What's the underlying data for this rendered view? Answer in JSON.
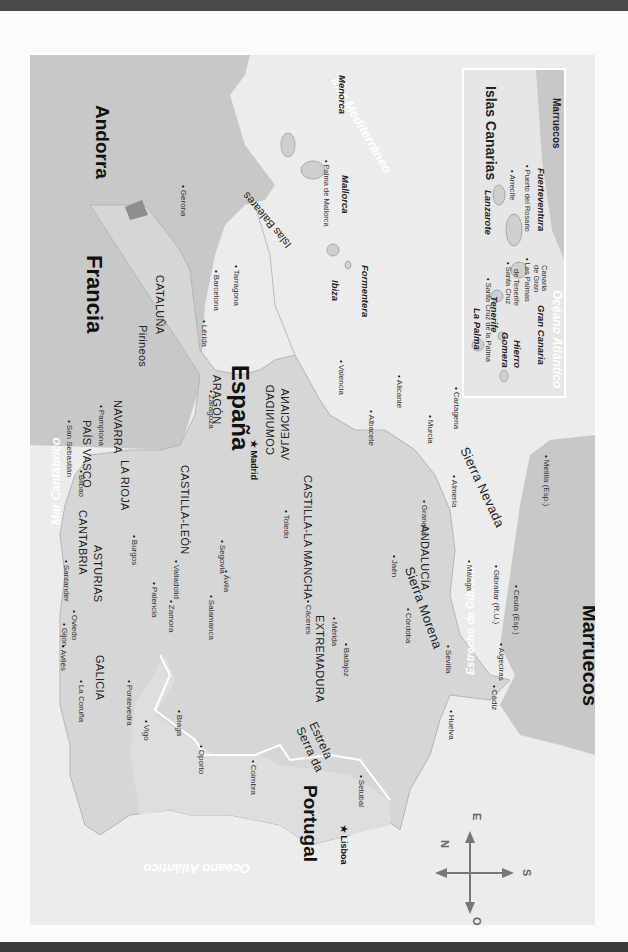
{
  "map": {
    "title": "España",
    "countries": {
      "spain": "España",
      "portugal": "Portugal",
      "france": "Francia",
      "andorra": "Andorra",
      "morocco_main": "Marruecos",
      "morocco_inset": "Marruecos"
    },
    "seas": {
      "cantabrico": "Mar Cantábrico",
      "mediterraneo": "Mar Mediterráneo",
      "atlantico": "Océano Atlántico",
      "atlantico_inset": "Océano Atlántico",
      "gibraltar": "Estrecho de Gibraltar"
    },
    "regions": {
      "galicia": "GALICIA",
      "asturias": "ASTURIAS",
      "cantabria": "CANTABRIA",
      "pais_vasco": "PAÍS VASCO",
      "navarra": "NAVARRA",
      "la_rioja": "LA RIOJA",
      "aragon": "ARAGÓN",
      "cataluna": "CATALUÑA",
      "castilla_leon": "CASTILLA-LEÓN",
      "castilla_mancha": "CASTILLA-LA MANCHA",
      "comunidad": "COMUNIDAD",
      "valenciana": "VALENCIANA",
      "extremadura": "EXTREMADURA",
      "andalucia": "ANDALUCÍA"
    },
    "mountains": {
      "pirineos": "Pirineos",
      "sierra_morena": "Sierra Morena",
      "sierra_nevada": "Sierra Nevada",
      "serra": "Serra da",
      "estrela": "Estrela"
    },
    "capitals": {
      "madrid": "Madrid",
      "lisboa": "Lisboa"
    },
    "cities": {
      "gijon": "Gijón",
      "aviles": "Avilés",
      "oviedo": "Oviedo",
      "santander": "Santander",
      "bilbao": "Bilbao",
      "san_sebastian": "San Sebastián",
      "pamplona": "Pamplona",
      "la_coruna": "La Coruña",
      "pontevedra": "Pontevedra",
      "vigo": "Vigo",
      "braga": "Braga",
      "oporto": "Oporto",
      "coimbra": "Coimbra",
      "setubal": "Setúbal",
      "burgos": "Burgos",
      "palencia": "Palencia",
      "valladolid": "Valladolid",
      "zamora": "Zamora",
      "salamanca": "Salamanca",
      "avila": "Ávila",
      "segovia": "Segovia",
      "toledo": "Toledo",
      "caceres": "Cáceres",
      "merida": "Mérida",
      "badajoz": "Badajoz",
      "huelva": "Huelva",
      "sevilla": "Sevilla",
      "cordoba": "Córdoba",
      "jaen": "Jaén",
      "granada": "Granada",
      "almeria": "Almería",
      "malaga": "Málaga",
      "cadiz": "Cádiz",
      "algeciras": "Algeciras",
      "gibraltar": "Gibraltar (R.U.)",
      "ceuta": "Ceuta (Esp.)",
      "melilla": "Melilla (Esp.)",
      "murcia": "Murcia",
      "cartagena": "Cartagena",
      "alicante": "Alicante",
      "albacete": "Albacete",
      "valencia": "Valencia",
      "zaragoza": "Zaragoza",
      "lerida": "Lérida",
      "barcelona": "Barcelona",
      "tarragona": "Tarragona",
      "gerona": "Gerona",
      "palma": "Palma de Mallorca"
    },
    "baleares": {
      "group": "Islas Baleares",
      "menorca": "Menorca",
      "mallorca": "Mallorca",
      "ibiza": "Ibiza",
      "formentera": "Formentera"
    },
    "canarias": {
      "title": "Islas Canarias",
      "islands": {
        "la_palma": "La Palma",
        "tenerife": "Tenerife",
        "gomera": "Gomera",
        "hierro": "Hierro",
        "gran_canaria": "Gran Canaria",
        "lanzarote": "Lanzarote",
        "fuerteventura": "Fuerteventura"
      },
      "cities": {
        "santa_cruz_palma": "Santa Cruz de la Palma",
        "santa_cruz_tenerife_1": "Santa Cruz",
        "santa_cruz_tenerife_2": "de Tenerife",
        "las_palmas_1": "Las Palmas",
        "las_palmas_2": "de Gran",
        "las_palmas_3": "Canaria",
        "arrecife": "Arrecife",
        "puerto_rosario": "Puerto del Rosario"
      }
    },
    "compass": {
      "n": "N",
      "s": "S",
      "e": "E",
      "o": "O"
    },
    "colors": {
      "sea": "#ececec",
      "land_spain": "#d8d8d8",
      "land_foreign": "#c9c9c9",
      "border": "#ffffff",
      "text": "#222222"
    }
  }
}
